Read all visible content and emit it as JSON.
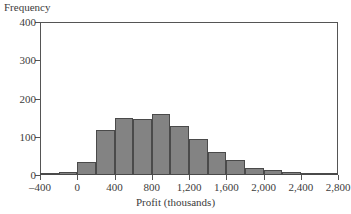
{
  "chart_data": {
    "type": "bar",
    "title": "",
    "subtitle": "",
    "xlabel": "Profit (thousands)",
    "ylabel": "Frequency",
    "grid": false,
    "legend": null,
    "bin_width": 200,
    "xlim": [
      -400,
      2800
    ],
    "ylim": [
      0,
      400
    ],
    "xticks": [
      -400,
      0,
      400,
      800,
      1200,
      1600,
      2000,
      2400,
      2800
    ],
    "xtick_labels": [
      "–400",
      "0",
      "400",
      "800",
      "1,200",
      "1,600",
      "2,000",
      "2,400",
      "2,800"
    ],
    "yticks": [
      0,
      100,
      200,
      300,
      400
    ],
    "ytick_labels": [
      "0",
      "100",
      "200",
      "300",
      "400"
    ],
    "bin_edges": [
      -400,
      -200,
      0,
      200,
      400,
      600,
      800,
      1000,
      1200,
      1400,
      1600,
      1800,
      2000,
      2200,
      2400,
      2600,
      2800
    ],
    "categories": [
      "-400 to -200",
      "-200 to 0",
      "0 to 200",
      "200 to 400",
      "400 to 600",
      "600 to 800",
      "800 to 1,000",
      "1,000 to 1,200",
      "1,200 to 1,400",
      "1,400 to 1,600",
      "1,600 to 1,800",
      "1,800 to 2,000",
      "2,000 to 2,200",
      "2,200 to 2,400",
      "2,400 to 2,600",
      "2,600 to 2,800"
    ],
    "values": [
      3,
      8,
      35,
      117,
      150,
      147,
      160,
      128,
      95,
      61,
      40,
      19,
      14,
      8,
      2,
      2
    ],
    "bar_color": "#838383",
    "bar_edge_color": "#4a4a4a",
    "axis_color": "#555555",
    "text_color": "#3c3c3c"
  }
}
